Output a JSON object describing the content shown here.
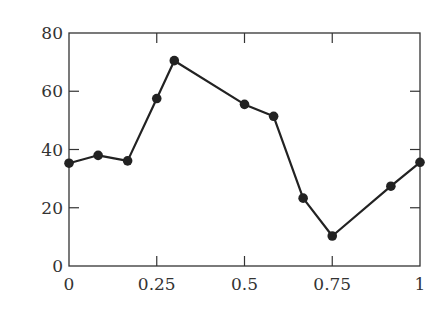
{
  "chart_data": {
    "type": "line",
    "title": "",
    "xlabel": "",
    "ylabel": "",
    "xlim": [
      0,
      1
    ],
    "ylim": [
      0,
      80
    ],
    "grid": false,
    "legend": null,
    "x_ticks": [
      0,
      0.25,
      0.5,
      0.75,
      1
    ],
    "x_tick_labels": [
      "0",
      "0.25",
      "0.5",
      "0.75",
      "1"
    ],
    "y_ticks": [
      0,
      20,
      40,
      60,
      80
    ],
    "y_tick_labels": [
      "0",
      "20",
      "40",
      "60",
      "80"
    ],
    "series": [
      {
        "name": "series-1",
        "color": "#222222",
        "marker": "circle",
        "x": [
          0,
          0.083,
          0.167,
          0.25,
          0.3,
          0.5,
          0.583,
          0.667,
          0.75,
          0.917,
          1
        ],
        "y": [
          35.3,
          38,
          36.1,
          57.5,
          70.5,
          55.5,
          51.4,
          23.3,
          10.3,
          27.4,
          35.6
        ]
      }
    ]
  }
}
